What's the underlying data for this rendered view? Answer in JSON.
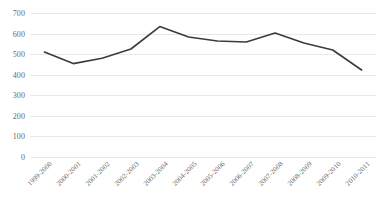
{
  "chart_data": {
    "type": "line",
    "title": "",
    "subtitle": "",
    "xlabel": "",
    "ylabel": "",
    "categories": [
      "1999-2000",
      "2000-2001",
      "2001-2002",
      "2002-2003",
      "2003-2004",
      "2004-2005",
      "2005-2006",
      "2006-2007",
      "2007-2008",
      "2008-2009",
      "2009-2010",
      "2010-2011"
    ],
    "values": [
      510,
      454,
      480,
      525,
      634,
      583,
      564,
      559,
      603,
      554,
      520,
      423
    ],
    "series": [
      {
        "name": "Series 1",
        "color": "#3b3b3b",
        "values": [
          510,
          454,
          480,
          525,
          634,
          583,
          564,
          559,
          603,
          554,
          520,
          423
        ]
      }
    ],
    "ylim": [
      0,
      700
    ],
    "ytick_values": [
      700,
      600,
      500,
      400,
      300,
      200,
      100,
      0
    ],
    "ytick_labels": [
      "700",
      "600",
      "500",
      "400",
      "300",
      "200",
      "100",
      "0"
    ],
    "grid": true,
    "grid_color": "#e8e8e8",
    "legend": false,
    "legend_position": "none",
    "x_tick_rotation": -45,
    "background_color": "#ffffff",
    "axis_label_color": "#6a6a6a"
  }
}
